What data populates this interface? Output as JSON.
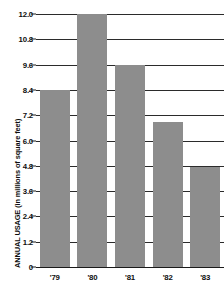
{
  "chart_data": {
    "type": "bar",
    "title": "",
    "xlabel": "",
    "ylabel": "ANNUAL USAGE (in millions of square feet)",
    "categories": [
      "'79",
      "'80",
      "'81",
      "'82",
      "'83"
    ],
    "values": [
      8.4,
      12.0,
      9.6,
      6.9,
      4.75
    ],
    "ylim": [
      0,
      12.0
    ],
    "ytick_labels": [
      "12.0",
      "10.8",
      "9.6",
      "8.4",
      "7.2",
      "6.0",
      "4.8",
      "3.6",
      "2.4",
      "1.2",
      "0"
    ],
    "ytick_values": [
      12.0,
      10.8,
      9.6,
      8.4,
      7.2,
      6.0,
      4.8,
      3.6,
      2.4,
      1.2,
      0
    ],
    "grid": true,
    "legend": "none",
    "bar_color": "#8d8d8d",
    "axis_color": "#1a1a1a",
    "background_color": "#ffffff"
  }
}
